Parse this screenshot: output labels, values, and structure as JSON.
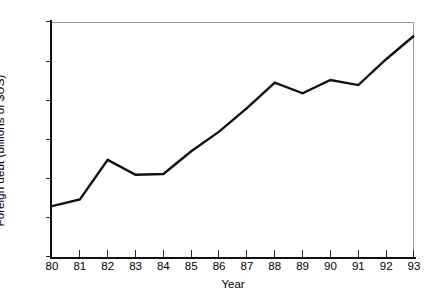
{
  "chart_data": {
    "type": "line",
    "title": "",
    "xlabel": "Year",
    "ylabel": "Foreign debt (billions of $US)",
    "categories": [
      "80",
      "81",
      "82",
      "83",
      "84",
      "85",
      "86",
      "87",
      "88",
      "89",
      "90",
      "91",
      "92",
      "93"
    ],
    "x": [
      1980,
      1981,
      1982,
      1983,
      1984,
      1985,
      1986,
      1987,
      1988,
      1989,
      1990,
      1991,
      1992,
      1993
    ],
    "values": [
      13.0,
      14.7,
      24.8,
      21.0,
      21.2,
      27.0,
      32.0,
      38.0,
      44.5,
      41.8,
      45.2,
      43.9,
      50.5,
      56.5
    ],
    "series": [
      {
        "name": "Foreign debt",
        "values": [
          13.0,
          14.7,
          24.8,
          21.0,
          21.2,
          27.0,
          32.0,
          38.0,
          44.5,
          41.8,
          45.2,
          43.9,
          50.5,
          56.5
        ],
        "color": "#111111"
      }
    ],
    "xlim": [
      1980,
      1993
    ],
    "ylim": [
      0,
      60
    ],
    "yticks": [
      0,
      10,
      20,
      30,
      40,
      50,
      60
    ],
    "ytick_labels": [
      "0",
      "10",
      "20",
      "30",
      "40",
      "50",
      "60"
    ],
    "xticks": [
      1980,
      1981,
      1982,
      1983,
      1984,
      1985,
      1986,
      1987,
      1988,
      1989,
      1990,
      1991,
      1992,
      1993
    ],
    "xtick_labels": [
      "80",
      "81",
      "82",
      "83",
      "84",
      "85",
      "86",
      "87",
      "88",
      "89",
      "90",
      "91",
      "92",
      "93"
    ],
    "grid": false,
    "legend": false,
    "legend_position": "none",
    "line_color": "#111111",
    "line_width": 2.4,
    "axis_color": "#101010",
    "frame_color": "#9a9a9a",
    "background": "#ffffff"
  }
}
